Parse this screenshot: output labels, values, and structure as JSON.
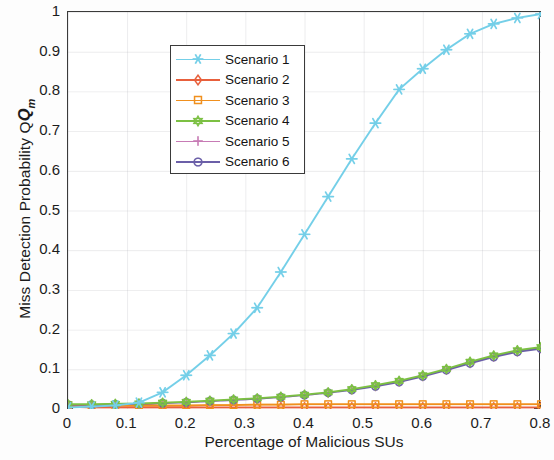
{
  "chart_data": {
    "type": "line",
    "title": "",
    "xlabel": "Percentage of Malicious SUs",
    "ylabel": "Miss Detection Probability Q",
    "ylabel_sub": "m",
    "xlim": [
      0,
      0.8
    ],
    "ylim": [
      0,
      1
    ],
    "xticks": [
      "0",
      "0.1",
      "0.2",
      "0.3",
      "0.4",
      "0.5",
      "0.6",
      "0.7",
      "0.8"
    ],
    "xtick_values": [
      0,
      0.1,
      0.2,
      0.3,
      0.4,
      0.5,
      0.6,
      0.7,
      0.8
    ],
    "yticks": [
      "0",
      "0.1",
      "0.2",
      "0.3",
      "0.4",
      "0.5",
      "0.6",
      "0.7",
      "0.8",
      "0.9",
      "1"
    ],
    "ytick_values": [
      0,
      0.1,
      0.2,
      0.3,
      0.4,
      0.5,
      0.6,
      0.7,
      0.8,
      0.9,
      1
    ],
    "grid": true,
    "legend_position": "upper left",
    "x": [
      0,
      0.04,
      0.08,
      0.12,
      0.16,
      0.2,
      0.24,
      0.28,
      0.32,
      0.36,
      0.4,
      0.44,
      0.48,
      0.52,
      0.56,
      0.6,
      0.64,
      0.68,
      0.72,
      0.76,
      0.8
    ],
    "series": [
      {
        "name": "Scenario 1",
        "color": "#74CFE8",
        "marker": "asterisk",
        "values": [
          0.004,
          0.006,
          0.009,
          0.016,
          0.042,
          0.085,
          0.135,
          0.19,
          0.255,
          0.345,
          0.44,
          0.535,
          0.63,
          0.72,
          0.805,
          0.857,
          0.905,
          0.945,
          0.97,
          0.985,
          0.995
        ]
      },
      {
        "name": "Scenario 2",
        "color": "#E8603C",
        "marker": "diamond",
        "values": [
          0.006,
          0.004,
          0.004,
          0.004,
          0.004,
          0.004,
          0.004,
          0.004,
          0.004,
          0.004,
          0.004,
          0.004,
          0.004,
          0.004,
          0.004,
          0.004,
          0.004,
          0.004,
          0.004,
          0.004,
          0.004
        ]
      },
      {
        "name": "Scenario 3",
        "color": "#F0901E",
        "marker": "square",
        "values": [
          0.01,
          0.009,
          0.009,
          0.009,
          0.009,
          0.009,
          0.01,
          0.01,
          0.011,
          0.011,
          0.012,
          0.012,
          0.012,
          0.012,
          0.012,
          0.012,
          0.012,
          0.012,
          0.012,
          0.012,
          0.012
        ]
      },
      {
        "name": "Scenario 4",
        "color": "#7CC043",
        "marker": "hexagram",
        "values": [
          0.012,
          0.012,
          0.013,
          0.014,
          0.016,
          0.018,
          0.021,
          0.024,
          0.027,
          0.031,
          0.036,
          0.042,
          0.05,
          0.06,
          0.071,
          0.085,
          0.101,
          0.119,
          0.135,
          0.148,
          0.156
        ]
      },
      {
        "name": "Scenario 5",
        "color": "#C77BB5",
        "marker": "plus",
        "values": [
          0.011,
          0.011,
          0.012,
          0.013,
          0.015,
          0.017,
          0.02,
          0.023,
          0.026,
          0.03,
          0.035,
          0.041,
          0.049,
          0.058,
          0.069,
          0.083,
          0.099,
          0.116,
          0.132,
          0.145,
          0.153
        ]
      },
      {
        "name": "Scenario 6",
        "color": "#6B5FA8",
        "marker": "circle",
        "values": [
          0.011,
          0.011,
          0.012,
          0.013,
          0.015,
          0.017,
          0.02,
          0.023,
          0.026,
          0.03,
          0.035,
          0.041,
          0.048,
          0.057,
          0.068,
          0.082,
          0.098,
          0.115,
          0.131,
          0.144,
          0.152
        ]
      }
    ]
  }
}
